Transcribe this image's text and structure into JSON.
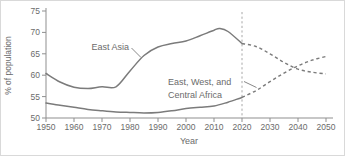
{
  "figure": {
    "ylabel": "% of population",
    "xlabel": "Year"
  },
  "chart_data": {
    "type": "line",
    "title": "",
    "xlabel": "Year",
    "ylabel": "% of population",
    "xlim": [
      1950,
      2050
    ],
    "ylim": [
      50,
      75
    ],
    "xticks": [
      1950,
      1960,
      1970,
      1980,
      1990,
      2000,
      2010,
      2020,
      2030,
      2040,
      2050
    ],
    "yticks": [
      50,
      55,
      60,
      65,
      70,
      75
    ],
    "grid": false,
    "legend_position": "inline-annotations",
    "projection_divider_year": 2020,
    "projection_style": "dashed",
    "line_color": "#7b7b7b",
    "axis_color": "#8f8f8f",
    "text_color": "#6b6b6b",
    "divider_color": "#a8a8a8",
    "series": [
      {
        "name": "East Asia",
        "label_lines": [
          "East Asia"
        ],
        "solid_points": [
          [
            1950,
            60.4
          ],
          [
            1955,
            58.4
          ],
          [
            1960,
            57.2
          ],
          [
            1965,
            56.9
          ],
          [
            1970,
            57.3
          ],
          [
            1975,
            57.3
          ],
          [
            1980,
            61.0
          ],
          [
            1985,
            64.6
          ],
          [
            1990,
            66.6
          ],
          [
            1995,
            67.4
          ],
          [
            2000,
            68.0
          ],
          [
            2005,
            69.2
          ],
          [
            2010,
            70.5
          ],
          [
            2012,
            70.9
          ],
          [
            2015,
            70.2
          ],
          [
            2020,
            67.4
          ]
        ],
        "projected_points": [
          [
            2020,
            67.4
          ],
          [
            2025,
            66.7
          ],
          [
            2030,
            65.0
          ],
          [
            2035,
            63.0
          ],
          [
            2040,
            61.4
          ],
          [
            2045,
            60.7
          ],
          [
            2050,
            60.3
          ]
        ]
      },
      {
        "name": "East, West, and Central Africa",
        "label_lines": [
          "East, West, and",
          "Central Africa"
        ],
        "solid_points": [
          [
            1950,
            53.5
          ],
          [
            1955,
            53.0
          ],
          [
            1960,
            52.5
          ],
          [
            1965,
            52.0
          ],
          [
            1970,
            51.7
          ],
          [
            1975,
            51.4
          ],
          [
            1980,
            51.3
          ],
          [
            1985,
            51.2
          ],
          [
            1990,
            51.3
          ],
          [
            1995,
            51.7
          ],
          [
            2000,
            52.2
          ],
          [
            2005,
            52.5
          ],
          [
            2010,
            52.8
          ],
          [
            2015,
            53.7
          ],
          [
            2020,
            54.8
          ]
        ],
        "projected_points": [
          [
            2020,
            54.8
          ],
          [
            2025,
            56.4
          ],
          [
            2030,
            58.5
          ],
          [
            2035,
            60.5
          ],
          [
            2040,
            62.2
          ],
          [
            2045,
            63.5
          ],
          [
            2050,
            64.4
          ]
        ]
      }
    ]
  }
}
